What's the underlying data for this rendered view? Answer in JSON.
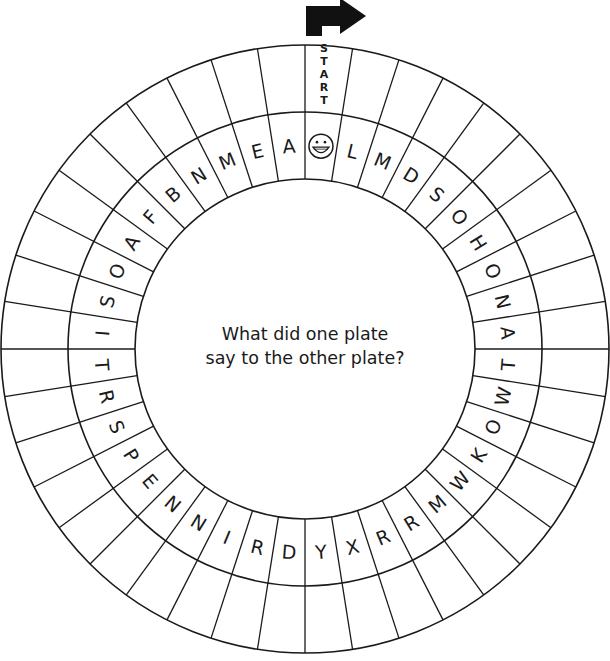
{
  "puzzle": {
    "start_label": "START",
    "start_icon": "arrow-right-turn-icon",
    "question_lines": [
      "What did one plate",
      "say to the other plate?"
    ],
    "segment_count": 40,
    "start_segment_icon": "smiley-face-icon",
    "letters_clockwise_from_start": [
      "L",
      "M",
      "D",
      "S",
      "O",
      "H",
      "O",
      "N",
      "A",
      "T",
      "W",
      "O",
      "K",
      "W",
      "M",
      "R",
      "R",
      "X",
      "Y",
      "D",
      "R",
      "I",
      "N",
      "N",
      "E",
      "P",
      "S",
      "R",
      "T",
      "I",
      "S",
      "O",
      "A",
      "F",
      "B",
      "N",
      "M",
      "E",
      "A"
    ],
    "colors": {
      "ink": "#1a1a1a",
      "background": "#ffffff"
    }
  }
}
